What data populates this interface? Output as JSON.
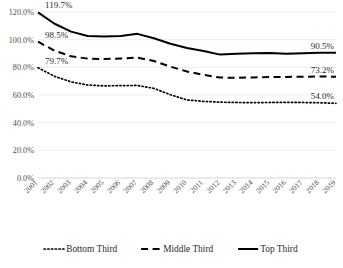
{
  "chart_data": {
    "type": "line",
    "title": "",
    "xlabel": "",
    "ylabel": "",
    "ylim": [
      0,
      120
    ],
    "ytick_labels": [
      "0.0%",
      "20.0%",
      "40.0%",
      "60.0%",
      "80.0%",
      "100.0%",
      "120.0%"
    ],
    "ytick_values": [
      0,
      20,
      40,
      60,
      80,
      100,
      120
    ],
    "grid": true,
    "legend_position": "bottom",
    "x": [
      "2001",
      "2002",
      "2003",
      "2004",
      "2005",
      "2006",
      "2007",
      "2008",
      "2009",
      "2010",
      "2011",
      "2012",
      "2013",
      "2014",
      "2015",
      "2016",
      "2017",
      "2018",
      "2019"
    ],
    "series": [
      {
        "name": "Bottom Third",
        "style": "dotted",
        "color": "#000000",
        "values": [
          79.7,
          73.5,
          69.5,
          67.2,
          66.6,
          66.8,
          66.9,
          64.8,
          60.2,
          56.4,
          55.4,
          54.8,
          54.6,
          54.5,
          54.6,
          54.7,
          54.6,
          54.4,
          54.0
        ],
        "start_label": "79.7%",
        "end_label": "54.0%"
      },
      {
        "name": "Middle Third",
        "style": "dashed",
        "color": "#000000",
        "values": [
          98.5,
          92.0,
          88.0,
          86.3,
          86.0,
          86.4,
          87.0,
          84.6,
          80.5,
          77.0,
          74.6,
          72.6,
          72.4,
          72.7,
          73.0,
          73.1,
          73.2,
          73.4,
          73.2
        ],
        "start_label": "98.5%",
        "end_label": "73.2%"
      },
      {
        "name": "Top Third",
        "style": "solid",
        "color": "#000000",
        "values": [
          119.7,
          111.5,
          105.8,
          102.6,
          102.2,
          102.6,
          104.2,
          101.0,
          97.0,
          94.0,
          91.8,
          89.2,
          89.8,
          90.2,
          90.4,
          89.9,
          90.2,
          90.6,
          90.5
        ],
        "start_label": "119.7%",
        "end_label": "90.5%"
      }
    ],
    "annotations": [
      {
        "text": "119.7%",
        "series": "Top Third",
        "at": "2001"
      },
      {
        "text": "98.5%",
        "series": "Middle Third",
        "at": "2001"
      },
      {
        "text": "79.7%",
        "series": "Bottom Third",
        "at": "2001"
      },
      {
        "text": "90.5%",
        "series": "Top Third",
        "at": "2019"
      },
      {
        "text": "73.2%",
        "series": "Middle Third",
        "at": "2019"
      },
      {
        "text": "54.0%",
        "series": "Bottom Third",
        "at": "2019"
      }
    ]
  },
  "legend": {
    "items": [
      {
        "label": "Bottom Third",
        "style": "dotted"
      },
      {
        "label": "Middle Third",
        "style": "dashed"
      },
      {
        "label": "Top Third",
        "style": "solid"
      }
    ]
  }
}
